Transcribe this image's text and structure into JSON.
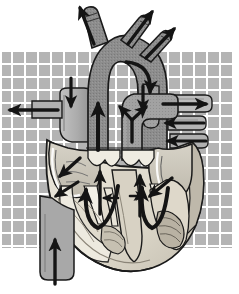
{
  "figure": {
    "title": "Heart Cross Section Blood Flow Diagram",
    "style": "grayscale medical illustration",
    "width": 239,
    "height": 294
  },
  "background": {
    "name": "checkerboard-grid",
    "page_color": "#ffffff",
    "cell_color": "#b4b4b4",
    "line_color": "#ffffff",
    "cell_size": 11,
    "gap": 2,
    "rect": {
      "x": 2,
      "y": 50,
      "width": 231,
      "height": 198
    }
  },
  "palette": {
    "vessel_dark": "#8a8a8a",
    "vessel_mid": "#9d9d9d",
    "vessel_light": "#b9b9b9",
    "chamber_light": "#cfcbc0",
    "myocardium": "#e3ded2",
    "myocardium_shade": "#c3bdb0",
    "endocardium": "#f2efe6",
    "outline": "#1a1a1a",
    "arrow": "#141414",
    "highlight": "#ffffff"
  },
  "structures": [
    {
      "id": "aorta-ascending",
      "label": "Ascending aorta",
      "fill": "vessel_dark"
    },
    {
      "id": "aortic-arch",
      "label": "Aortic arch",
      "fill": "vessel_dark"
    },
    {
      "id": "brachiocephalic-trunk",
      "label": "Brachiocephalic trunk",
      "fill": "vessel_dark"
    },
    {
      "id": "left-common-carotid-artery",
      "label": "Left common carotid artery",
      "fill": "vessel_dark"
    },
    {
      "id": "left-subclavian-artery",
      "label": "Left subclavian artery",
      "fill": "vessel_dark"
    },
    {
      "id": "superior-vena-cava",
      "label": "Superior vena cava",
      "fill": "vessel_light"
    },
    {
      "id": "inferior-vena-cava",
      "label": "Inferior vena cava",
      "fill": "vessel_light"
    },
    {
      "id": "pulmonary-trunk",
      "label": "Pulmonary trunk",
      "fill": "vessel_mid"
    },
    {
      "id": "right-pulmonary-artery",
      "label": "Right pulmonary artery",
      "fill": "vessel_mid"
    },
    {
      "id": "left-pulmonary-artery",
      "label": "Left pulmonary artery",
      "fill": "vessel_mid"
    },
    {
      "id": "pulmonary-veins",
      "label": "Pulmonary veins",
      "fill": "vessel_light"
    },
    {
      "id": "right-atrium",
      "label": "Right atrium",
      "fill": "chamber_light"
    },
    {
      "id": "left-atrium",
      "label": "Left atrium",
      "fill": "chamber_light"
    },
    {
      "id": "right-ventricle",
      "label": "Right ventricle",
      "fill": "endocardium"
    },
    {
      "id": "left-ventricle",
      "label": "Left ventricle",
      "fill": "endocardium"
    },
    {
      "id": "interventricular-septum",
      "label": "Interventricular septum",
      "fill": "myocardium"
    },
    {
      "id": "tricuspid-valve",
      "label": "Tricuspid valve",
      "fill": "endocardium"
    },
    {
      "id": "mitral-valve",
      "label": "Mitral valve",
      "fill": "endocardium"
    },
    {
      "id": "aortic-valve",
      "label": "Aortic semilunar valve",
      "fill": "endocardium"
    },
    {
      "id": "pulmonary-valve",
      "label": "Pulmonary semilunar valve",
      "fill": "endocardium"
    },
    {
      "id": "papillary-muscles",
      "label": "Papillary muscles",
      "fill": "myocardium_shade"
    },
    {
      "id": "chordae-tendineae",
      "label": "Chordae tendineae",
      "fill": "endocardium"
    },
    {
      "id": "myocardium-wall",
      "label": "Myocardium",
      "fill": "myocardium"
    },
    {
      "id": "apex",
      "label": "Apex of heart",
      "fill": "myocardium"
    }
  ],
  "flow_arrows": [
    {
      "id": "arrow-brachiocephalic-out",
      "direction": "up-left",
      "meaning": "blood exits via brachiocephalic trunk"
    },
    {
      "id": "arrow-carotid-out",
      "direction": "up-right",
      "meaning": "blood exits via left common carotid artery"
    },
    {
      "id": "arrow-subclavian-out",
      "direction": "up-right",
      "meaning": "blood exits via left subclavian artery"
    },
    {
      "id": "arrow-svc-in-down",
      "direction": "down",
      "meaning": "venous return descends superior vena cava"
    },
    {
      "id": "arrow-svc-in-left",
      "direction": "left",
      "meaning": "venous return enters right atrium"
    },
    {
      "id": "arrow-ascending-aorta-up",
      "direction": "up",
      "meaning": "oxygenated blood ascends the aorta"
    },
    {
      "id": "arrow-aortic-arch-curve",
      "direction": "curve-down",
      "meaning": "flow curves through aortic arch to descending aorta"
    },
    {
      "id": "arrow-descending-aorta-down",
      "direction": "down",
      "meaning": "flow descends the aorta"
    },
    {
      "id": "arrow-pulmonary-trunk-split",
      "direction": "y-split",
      "meaning": "deoxygenated blood splits to both lungs"
    },
    {
      "id": "arrow-right-pulmonary-artery",
      "direction": "right",
      "meaning": "blood to right lung"
    },
    {
      "id": "arrow-pulmonary-vein-upper",
      "direction": "left",
      "meaning": "oxygenated blood returns from lung"
    },
    {
      "id": "arrow-pulmonary-vein-lower",
      "direction": "left",
      "meaning": "oxygenated blood returns from lung"
    },
    {
      "id": "arrow-right-atrium-down",
      "direction": "down-left",
      "meaning": "right atrium empties into right ventricle"
    },
    {
      "id": "arrow-left-atrium-down",
      "direction": "down-left",
      "meaning": "left atrium empties into left ventricle"
    },
    {
      "id": "arrow-right-ventricle-loop",
      "direction": "u-turn",
      "meaning": "right ventricle ejects into pulmonary trunk"
    },
    {
      "id": "arrow-left-ventricle-loop",
      "direction": "u-turn",
      "meaning": "left ventricle ejects into aorta"
    },
    {
      "id": "arrow-aortic-valve-up",
      "direction": "up",
      "meaning": "blood passes aortic semilunar valve"
    },
    {
      "id": "arrow-pulmonary-valve-up",
      "direction": "up",
      "meaning": "blood passes pulmonary semilunar valve"
    },
    {
      "id": "arrow-ivc-up",
      "direction": "up",
      "meaning": "venous return ascends inferior vena cava"
    }
  ]
}
